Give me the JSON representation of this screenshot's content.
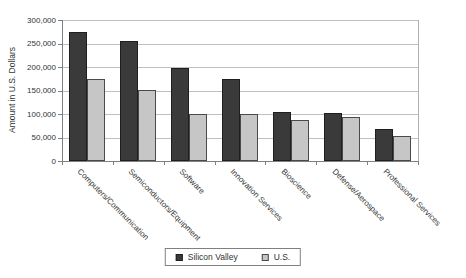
{
  "chart_data": {
    "type": "bar",
    "title": "",
    "xlabel": "",
    "ylabel": "Amount in U.S. Dollars",
    "categories": [
      "Computers/Communication",
      "Semiconductors/Equipment",
      "Software",
      "Innovation Services",
      "Bioscience",
      "Defense/Aerospace",
      "Professional Services"
    ],
    "series": [
      {
        "name": "Silicon Valley",
        "color": "#3a3a3a",
        "border_color": "#1f1f1f",
        "values": [
          275000,
          255000,
          197000,
          175000,
          104000,
          102000,
          69000
        ]
      },
      {
        "name": "U.S.",
        "color": "#c6c6c6",
        "border_color": "#4a4a4a",
        "values": [
          175000,
          152000,
          100000,
          99000,
          88000,
          93000,
          53000
        ]
      }
    ],
    "ylim": [
      0,
      300000
    ],
    "ytick_step": 50000,
    "ytick_labels": [
      "0",
      "50,000",
      "100,000",
      "150,000",
      "200,000",
      "250,000",
      "300,000"
    ],
    "grid": true,
    "legend_position": "bottom-center"
  }
}
